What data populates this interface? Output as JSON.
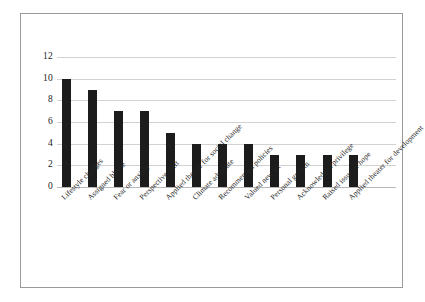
{
  "chart_data": {
    "type": "bar",
    "title": "",
    "subtitle": "",
    "xlabel": "",
    "ylabel": "",
    "ylim": [
      0,
      12
    ],
    "yticks": [
      "0",
      "2",
      "4",
      "6",
      "8",
      "10",
      "12"
    ],
    "grid": true,
    "legend": false,
    "legend_position": "none",
    "bar_color": "#1c1c1c",
    "gridline_color": "#d2d2d2",
    "axis_color": "#b8b8b8",
    "border_color": "#9a9a9a",
    "background_color": "#ffffff",
    "label_rotation_degrees": -45,
    "categories": [
      "Lifestyle changes",
      "Assigned blame",
      "Fear or anxiety",
      "Perspective shift",
      "Applied theater for social change",
      "Climate advocate",
      "Recommended policies",
      "Valued new art",
      "Personal growth",
      "Acknowledged privilege",
      "Raised issue of hope",
      "Applied theater for development"
    ],
    "values": [
      10,
      9,
      7,
      7,
      5,
      4,
      4,
      4,
      3,
      3,
      3,
      3
    ]
  }
}
